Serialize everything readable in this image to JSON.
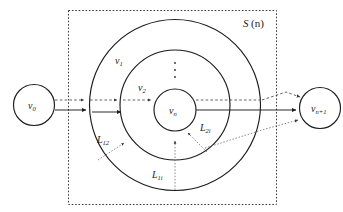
{
  "figure": {
    "title_label": "S (n)",
    "title_base": "S",
    "title_arg": "(n)",
    "background_color": "#ffffff",
    "stroke_color": "#1d1d1d"
  },
  "nodes": [
    {
      "id": "source",
      "base": "v",
      "sub": "0",
      "label": "v0"
    },
    {
      "id": "center",
      "base": "v",
      "sub": "n",
      "label": "vn"
    },
    {
      "id": "sink",
      "base": "v",
      "sub": "n+1",
      "label": "vn+1"
    }
  ],
  "rings": [
    {
      "id": "outer",
      "base": "v",
      "sub": "1",
      "label": "v1"
    },
    {
      "id": "middle",
      "base": "v",
      "sub": "2",
      "label": "v2"
    }
  ],
  "edge_labels": [
    {
      "id": "l12",
      "base": "L",
      "sub": "12",
      "label": "L12"
    },
    {
      "id": "l2i",
      "base": "L",
      "sub": "2i",
      "label": "L2i"
    },
    {
      "id": "l1i",
      "base": "L",
      "sub": "1i",
      "label": "L1i"
    }
  ],
  "ellipsis": {
    "label": "vertical-dots",
    "dot_count": 3
  }
}
